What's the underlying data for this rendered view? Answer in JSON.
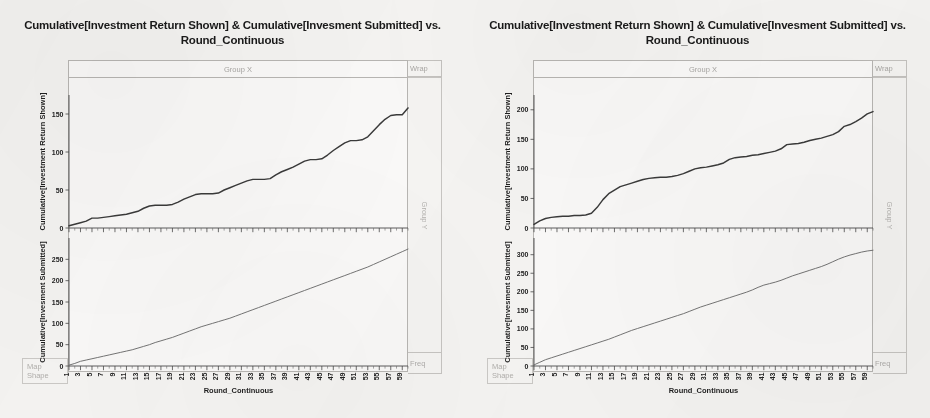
{
  "document": {
    "background_color": "#f4f3f1",
    "kind": "scanned-figure-page"
  },
  "panels": [
    {
      "id": "left",
      "title": "Cumulative[Investment Return Shown] & Cumulative[Invesment Submitted] vs. Round_Continuous",
      "group_x_label": "Group X",
      "wrap_label": "Wrap",
      "group_y_label": "Group Y",
      "freq_label": "Freq",
      "map_label": "Map",
      "shape_label": "Shape",
      "xlabel": "Round_Continuous"
    },
    {
      "id": "right",
      "title": "Cumulative[Investment Return Shown] & Cumulative[Invesment Submitted] vs. Round_Continuous",
      "group_x_label": "Group X",
      "wrap_label": "Wrap",
      "group_y_label": "Group Y",
      "freq_label": "Freq",
      "map_label": "Map",
      "shape_label": "Shape",
      "xlabel": "Round_Continuous"
    }
  ],
  "chart_data": [
    {
      "type": "line",
      "panel": "left",
      "subplot": "upper",
      "title": "Cumulative[Investment Return Shown] & Cumulative[Invesment Submitted] vs. Round_Continuous",
      "xlabel": "Round_Continuous",
      "ylabel": "Cumulative[Investment Return Shown]",
      "xlim": [
        1,
        60
      ],
      "ylim": [
        -6,
        175
      ],
      "yticks": [
        0,
        50,
        100,
        150
      ],
      "xticks": [
        1,
        3,
        5,
        7,
        9,
        11,
        13,
        15,
        17,
        19,
        21,
        23,
        25,
        27,
        29,
        31,
        33,
        35,
        37,
        39,
        41,
        43,
        45,
        47,
        49,
        51,
        53,
        55,
        57,
        59
      ],
      "grid": false,
      "legend": "none",
      "x": [
        1,
        2,
        3,
        4,
        5,
        6,
        7,
        8,
        9,
        10,
        11,
        12,
        13,
        14,
        15,
        16,
        17,
        18,
        19,
        20,
        21,
        22,
        23,
        24,
        25,
        26,
        27,
        28,
        29,
        30,
        31,
        32,
        33,
        34,
        35,
        36,
        37,
        38,
        39,
        40,
        41,
        42,
        43,
        44,
        45,
        46,
        47,
        48,
        49,
        50,
        51,
        52,
        53,
        54,
        55,
        56,
        57,
        58,
        59,
        60
      ],
      "values": [
        3,
        5,
        7,
        9,
        13,
        13,
        14,
        15,
        16,
        17,
        18,
        20,
        22,
        26,
        29,
        30,
        30,
        30,
        31,
        34,
        38,
        41,
        44,
        45,
        45,
        45,
        46,
        50,
        53,
        56,
        59,
        62,
        64,
        64,
        64,
        65,
        70,
        74,
        77,
        80,
        84,
        88,
        90,
        90,
        91,
        96,
        102,
        107,
        112,
        115,
        115,
        116,
        120,
        128,
        136,
        143,
        148,
        149,
        149,
        158
      ]
    },
    {
      "type": "line",
      "panel": "left",
      "subplot": "lower",
      "xlabel": "Round_Continuous",
      "ylabel": "Cumulative[Invesment Submitted]",
      "xlim": [
        1,
        60
      ],
      "ylim": [
        -8,
        300
      ],
      "yticks": [
        0,
        50,
        100,
        150,
        200,
        250
      ],
      "xticks": [
        1,
        3,
        5,
        7,
        9,
        11,
        13,
        15,
        17,
        19,
        21,
        23,
        25,
        27,
        29,
        31,
        33,
        35,
        37,
        39,
        41,
        43,
        45,
        47,
        49,
        51,
        53,
        55,
        57,
        59
      ],
      "grid": false,
      "legend": "none",
      "x": [
        1,
        2,
        3,
        4,
        5,
        6,
        7,
        8,
        9,
        10,
        11,
        12,
        13,
        14,
        15,
        16,
        17,
        18,
        19,
        20,
        21,
        22,
        23,
        24,
        25,
        26,
        27,
        28,
        29,
        30,
        31,
        32,
        33,
        34,
        35,
        36,
        37,
        38,
        39,
        40,
        41,
        42,
        43,
        44,
        45,
        46,
        47,
        48,
        49,
        50,
        51,
        52,
        53,
        54,
        55,
        56,
        57,
        58,
        59,
        60
      ],
      "values": [
        2,
        6,
        11,
        14,
        17,
        20,
        23,
        26,
        29,
        32,
        35,
        38,
        42,
        46,
        50,
        55,
        59,
        63,
        67,
        72,
        77,
        82,
        87,
        92,
        96,
        100,
        104,
        108,
        112,
        117,
        122,
        127,
        132,
        137,
        142,
        147,
        152,
        157,
        162,
        167,
        172,
        177,
        182,
        187,
        192,
        197,
        202,
        207,
        212,
        217,
        222,
        227,
        232,
        238,
        244,
        250,
        256,
        262,
        268,
        274
      ]
    },
    {
      "type": "line",
      "panel": "right",
      "subplot": "upper",
      "title": "Cumulative[Investment Return Shown] & Cumulative[Invesment Submitted] vs. Round_Continuous",
      "xlabel": "Round_Continuous",
      "ylabel": "Cumulative[Investment Return Shown]",
      "xlim": [
        1,
        60
      ],
      "ylim": [
        -8,
        225
      ],
      "yticks": [
        0,
        50,
        100,
        150,
        200
      ],
      "xticks": [
        1,
        3,
        5,
        7,
        9,
        11,
        13,
        15,
        17,
        19,
        21,
        23,
        25,
        27,
        29,
        31,
        33,
        35,
        37,
        39,
        41,
        43,
        45,
        47,
        49,
        51,
        53,
        55,
        57,
        59
      ],
      "grid": false,
      "legend": "none",
      "x": [
        1,
        2,
        3,
        4,
        5,
        6,
        7,
        8,
        9,
        10,
        11,
        12,
        13,
        14,
        15,
        16,
        17,
        18,
        19,
        20,
        21,
        22,
        23,
        24,
        25,
        26,
        27,
        28,
        29,
        30,
        31,
        32,
        33,
        34,
        35,
        36,
        37,
        38,
        39,
        40,
        41,
        42,
        43,
        44,
        45,
        46,
        47,
        48,
        49,
        50,
        51,
        52,
        53,
        54,
        55,
        56,
        57,
        58,
        59,
        60
      ],
      "values": [
        6,
        12,
        16,
        18,
        19,
        20,
        20,
        21,
        21,
        22,
        25,
        35,
        48,
        58,
        64,
        70,
        73,
        76,
        79,
        82,
        84,
        85,
        86,
        86,
        87,
        89,
        92,
        96,
        100,
        102,
        103,
        105,
        107,
        110,
        116,
        119,
        120,
        121,
        123,
        124,
        126,
        128,
        130,
        134,
        141,
        142,
        143,
        145,
        148,
        150,
        152,
        155,
        158,
        163,
        172,
        175,
        180,
        186,
        193,
        197
      ]
    },
    {
      "type": "line",
      "panel": "right",
      "subplot": "lower",
      "xlabel": "Round_Continuous",
      "ylabel": "Cumulative[Invesment Submitted]",
      "xlim": [
        1,
        60
      ],
      "ylim": [
        -8,
        345
      ],
      "yticks": [
        0,
        50,
        100,
        150,
        200,
        250,
        300
      ],
      "xticks": [
        1,
        3,
        5,
        7,
        9,
        11,
        13,
        15,
        17,
        19,
        21,
        23,
        25,
        27,
        29,
        31,
        33,
        35,
        37,
        39,
        41,
        43,
        45,
        47,
        49,
        51,
        53,
        55,
        57,
        59
      ],
      "grid": false,
      "legend": "none",
      "x": [
        1,
        2,
        3,
        4,
        5,
        6,
        7,
        8,
        9,
        10,
        11,
        12,
        13,
        14,
        15,
        16,
        17,
        18,
        19,
        20,
        21,
        22,
        23,
        24,
        25,
        26,
        27,
        28,
        29,
        30,
        31,
        32,
        33,
        34,
        35,
        36,
        37,
        38,
        39,
        40,
        41,
        42,
        43,
        44,
        45,
        46,
        47,
        48,
        49,
        50,
        51,
        52,
        53,
        54,
        55,
        56,
        57,
        58,
        59,
        60
      ],
      "values": [
        3,
        10,
        17,
        22,
        27,
        32,
        37,
        42,
        47,
        52,
        57,
        62,
        67,
        72,
        78,
        84,
        90,
        96,
        101,
        106,
        111,
        116,
        121,
        126,
        131,
        136,
        141,
        147,
        153,
        159,
        164,
        169,
        174,
        179,
        184,
        189,
        194,
        199,
        205,
        212,
        218,
        222,
        226,
        231,
        237,
        243,
        248,
        253,
        258,
        263,
        268,
        274,
        281,
        288,
        294,
        299,
        303,
        307,
        310,
        312
      ]
    }
  ]
}
